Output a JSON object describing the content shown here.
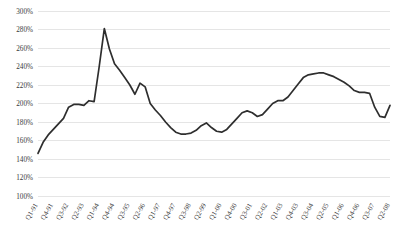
{
  "chart_data": {
    "type": "line",
    "title": "",
    "subtitle": "",
    "xlabel": "",
    "ylabel": "",
    "ylim": [
      100,
      300
    ],
    "ytick_step": 20,
    "grid": true,
    "legend": false,
    "legend_position": "none",
    "line_color": "#2e2e2e",
    "grid_color": "#d4d4d4",
    "tick_label_color": "#3a3a3a",
    "value_suffix": "%",
    "ytick_labels": [
      "100%",
      "120%",
      "140%",
      "160%",
      "180%",
      "200%",
      "220%",
      "240%",
      "260%",
      "280%",
      "300%"
    ],
    "ytick_values": [
      100,
      120,
      140,
      160,
      180,
      200,
      220,
      240,
      260,
      280,
      300
    ],
    "xtick_labels": [
      "Q1-91",
      "Q4-91",
      "Q3-92",
      "Q2-93",
      "Q1-94",
      "Q4-94",
      "Q3-95",
      "Q2-96",
      "Q1-97",
      "Q4-97",
      "Q3-98",
      "Q2-99",
      "Q1-00",
      "Q4-00",
      "Q3-01",
      "Q2-02",
      "Q1-03",
      "Q4-03",
      "Q3-04",
      "Q2-05",
      "Q1-06",
      "Q4-06",
      "Q3-07",
      "Q2-08"
    ],
    "xtick_interval_quarters": 3,
    "categories": [
      "Q1-91",
      "Q2-91",
      "Q3-91",
      "Q4-91",
      "Q1-92",
      "Q2-92",
      "Q3-92",
      "Q4-92",
      "Q1-93",
      "Q2-93",
      "Q3-93",
      "Q4-93",
      "Q1-94",
      "Q2-94",
      "Q3-94",
      "Q4-94",
      "Q1-95",
      "Q2-95",
      "Q3-95",
      "Q4-95",
      "Q1-96",
      "Q2-96",
      "Q3-96",
      "Q4-96",
      "Q1-97",
      "Q2-97",
      "Q3-97",
      "Q4-97",
      "Q1-98",
      "Q2-98",
      "Q3-98",
      "Q4-98",
      "Q1-99",
      "Q2-99",
      "Q3-99",
      "Q4-99",
      "Q1-00",
      "Q2-00",
      "Q3-00",
      "Q4-00",
      "Q1-01",
      "Q2-01",
      "Q3-01",
      "Q4-01",
      "Q1-02",
      "Q2-02",
      "Q3-02",
      "Q4-02",
      "Q1-03",
      "Q2-03",
      "Q3-03",
      "Q4-03",
      "Q1-04",
      "Q2-04",
      "Q3-04",
      "Q4-04",
      "Q1-05",
      "Q2-05",
      "Q3-05",
      "Q4-05",
      "Q1-06",
      "Q2-06",
      "Q3-06",
      "Q4-06",
      "Q1-07",
      "Q2-07",
      "Q3-07",
      "Q4-07",
      "Q1-08",
      "Q2-08"
    ],
    "values": [
      146,
      158,
      166,
      172,
      178,
      184,
      196,
      199,
      199,
      198,
      203,
      202,
      240,
      281,
      259,
      243,
      236,
      228,
      220,
      210,
      222,
      218,
      200,
      193,
      187,
      180,
      174,
      169,
      167,
      167,
      168,
      171,
      176,
      179,
      174,
      170,
      169,
      172,
      178,
      184,
      190,
      192,
      190,
      186,
      188,
      194,
      200,
      203,
      203,
      207,
      214,
      221,
      228,
      231,
      232,
      233,
      233,
      231,
      229,
      226,
      223,
      219,
      214,
      212,
      212,
      211,
      196,
      186,
      185,
      198
    ],
    "series_name": "Index",
    "first_value": 146,
    "peak_value": 281,
    "peak_category": "Q2-94",
    "trough_value": 167,
    "trough_category": "Q1-98",
    "last_value": 198,
    "last_category": "Q2-08"
  }
}
